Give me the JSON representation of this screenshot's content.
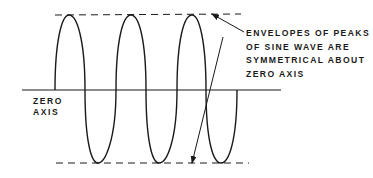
{
  "diagram": {
    "type": "sine-wave-envelope",
    "zero_axis_label": [
      "ZERO",
      "AXIS"
    ],
    "annotation_lines": [
      "ENVELOPES OF PEAKS",
      "OF SINE WAVE ARE",
      "SYMMETRICAL ABOUT",
      "ZERO AXIS"
    ],
    "wave": {
      "zero_axis_y": 90,
      "top_envelope_y": 15,
      "bottom_envelope_y": 163,
      "positive_lobes": [
        [
          55,
          85
        ],
        [
          116,
          146
        ],
        [
          177,
          206
        ]
      ],
      "negative_lobes": [
        [
          85,
          116
        ],
        [
          146,
          177
        ],
        [
          206,
          237
        ]
      ]
    },
    "colors": {
      "line": "#1a1a1a",
      "background": "#ffffff"
    }
  }
}
